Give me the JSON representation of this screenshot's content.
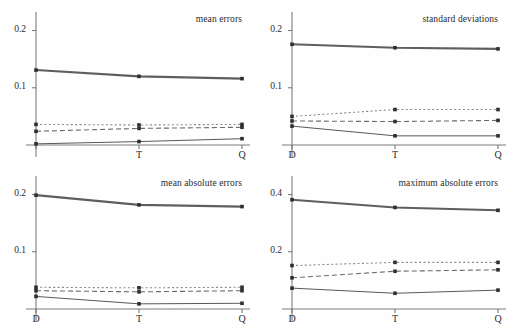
{
  "figure": {
    "layout": "2x2 grid of line charts",
    "categories": [
      "D",
      "T",
      "Q"
    ]
  },
  "chart_data": [
    {
      "type": "line",
      "title": "mean errors",
      "panel": "top-left",
      "x": [
        "D",
        "T",
        "Q"
      ],
      "xlabel": "",
      "ylabel": "",
      "xtick_labels": [
        "",
        "T",
        "Q"
      ],
      "ytick_labels": [
        "0.1",
        "0.2"
      ],
      "yticks": [
        0.1,
        0.2
      ],
      "ylim": [
        0,
        0.215
      ],
      "grid": false,
      "legend": "none",
      "series": [
        {
          "name": "series-1",
          "style": "thick-solid",
          "values": [
            0.131,
            0.12,
            0.116
          ]
        },
        {
          "name": "series-2",
          "style": "dotted",
          "values": [
            0.036,
            0.035,
            0.036
          ]
        },
        {
          "name": "series-3",
          "style": "dashed",
          "values": [
            0.024,
            0.029,
            0.031
          ]
        },
        {
          "name": "series-4",
          "style": "thin-solid",
          "values": [
            0.002,
            0.006,
            0.011
          ]
        }
      ]
    },
    {
      "type": "line",
      "title": "standard deviations",
      "panel": "top-right",
      "x": [
        "D",
        "T",
        "Q"
      ],
      "xlabel": "",
      "ylabel": "",
      "xtick_labels": [
        "D",
        "T",
        "Q"
      ],
      "ytick_labels": [
        "0.1",
        "0.2"
      ],
      "yticks": [
        0.1,
        0.2
      ],
      "ylim": [
        0,
        0.215
      ],
      "grid": false,
      "legend": "none",
      "series": [
        {
          "name": "series-1",
          "style": "thick-solid",
          "values": [
            0.176,
            0.17,
            0.168
          ]
        },
        {
          "name": "series-2",
          "style": "dotted",
          "values": [
            0.05,
            0.062,
            0.062
          ]
        },
        {
          "name": "series-3",
          "style": "dashed",
          "values": [
            0.042,
            0.041,
            0.043
          ]
        },
        {
          "name": "series-4",
          "style": "thin-solid",
          "values": [
            0.033,
            0.016,
            0.016
          ]
        }
      ]
    },
    {
      "type": "line",
      "title": "mean absolute errors",
      "panel": "bottom-left",
      "x": [
        "D",
        "T",
        "Q"
      ],
      "xlabel": "",
      "ylabel": "",
      "xtick_labels": [
        "D",
        "T",
        "Q"
      ],
      "ytick_labels": [
        "0.1",
        "0.2"
      ],
      "yticks": [
        0.1,
        0.2
      ],
      "ylim": [
        0,
        0.215
      ],
      "grid": false,
      "legend": "none",
      "series": [
        {
          "name": "series-1",
          "style": "thick-solid",
          "values": [
            0.199,
            0.182,
            0.179
          ]
        },
        {
          "name": "series-2",
          "style": "dotted",
          "values": [
            0.038,
            0.037,
            0.038
          ]
        },
        {
          "name": "series-3",
          "style": "dashed",
          "values": [
            0.032,
            0.03,
            0.032
          ]
        },
        {
          "name": "series-4",
          "style": "thin-solid",
          "values": [
            0.022,
            0.009,
            0.01
          ]
        }
      ]
    },
    {
      "type": "line",
      "title": "maximum absolute errors",
      "panel": "bottom-right",
      "x": [
        "D",
        "T",
        "Q"
      ],
      "xlabel": "",
      "ylabel": "",
      "xtick_labels": [
        "D",
        "T",
        "Q"
      ],
      "ytick_labels": [
        "0.2",
        "0.4"
      ],
      "yticks": [
        0.2,
        0.4
      ],
      "ylim": [
        0,
        0.43
      ],
      "grid": false,
      "legend": "none",
      "series": [
        {
          "name": "series-1",
          "style": "thick-solid",
          "values": [
            0.382,
            0.355,
            0.345
          ]
        },
        {
          "name": "series-2",
          "style": "dotted",
          "values": [
            0.152,
            0.163,
            0.163
          ]
        },
        {
          "name": "series-3",
          "style": "dashed",
          "values": [
            0.109,
            0.132,
            0.137
          ]
        },
        {
          "name": "series-4",
          "style": "thin-solid",
          "values": [
            0.073,
            0.055,
            0.066
          ]
        }
      ]
    }
  ]
}
